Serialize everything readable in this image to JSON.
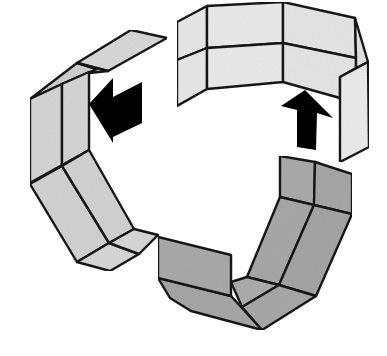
{
  "figure": {
    "colors": {
      "background": "#ffffff",
      "outline": "#1e1e1e",
      "top_strip": "#e9e9e9",
      "left_strip": "#d6d6d6",
      "bottom_strip": "#a9a9a9",
      "arrow": "#000000"
    },
    "parts": [
      {
        "name": "top-strip",
        "shade": "light"
      },
      {
        "name": "left-strip",
        "shade": "medium"
      },
      {
        "name": "bottom-strip",
        "shade": "dark"
      }
    ],
    "arrows": [
      {
        "name": "arrow-left",
        "direction": "left"
      },
      {
        "name": "arrow-up",
        "direction": "up"
      }
    ]
  }
}
